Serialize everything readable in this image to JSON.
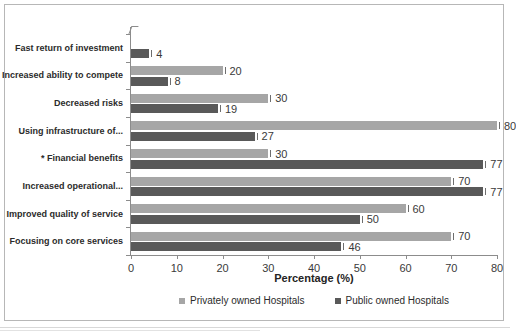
{
  "figure": {
    "xaxis_title": "Percentage (%)",
    "legend": [
      {
        "label": "Privately owned Hospitals",
        "color": "#a6a6a6",
        "key": "priv"
      },
      {
        "label": "Public owned Hospitals",
        "color": "#595959",
        "key": "pub"
      }
    ]
  },
  "chart_data": {
    "type": "bar",
    "orientation": "horizontal",
    "title": "",
    "xlabel": "Percentage (%)",
    "ylabel": "",
    "xlim": [
      0,
      80
    ],
    "xticks": [
      0,
      10,
      20,
      30,
      40,
      50,
      60,
      70,
      80
    ],
    "grid": false,
    "legend_position": "bottom-center",
    "categories": [
      "Fast return of investment",
      "Increased ability to compete",
      "Decreased risks",
      "Using infrastructure of...",
      "* Financial benefits",
      "Increased operational...",
      "Improved quality of service",
      "Focusing on core services"
    ],
    "series": [
      {
        "name": "Privately owned Hospitals",
        "color": "#a6a6a6",
        "values": [
          0,
          20,
          30,
          80,
          30,
          70,
          60,
          70
        ],
        "labels": [
          "",
          "20",
          "30",
          "80",
          "30",
          "70",
          "60",
          "70"
        ]
      },
      {
        "name": "Public owned Hospitals",
        "color": "#595959",
        "values": [
          4,
          8,
          19,
          27,
          77,
          77,
          50,
          46
        ],
        "labels": [
          "4",
          "8",
          "19",
          "27",
          "77",
          "77",
          "50",
          "46"
        ]
      }
    ]
  }
}
